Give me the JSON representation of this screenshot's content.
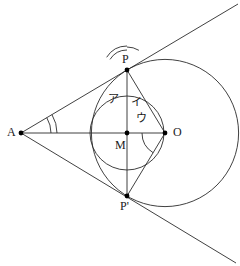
{
  "figure": {
    "width": 240,
    "height": 266,
    "background_color": "#ffffff",
    "stroke_color": "#2b2b2b",
    "point_color": "#000000"
  },
  "points": [
    {
      "id": "A",
      "label": "A",
      "x": 21,
      "y": 133,
      "label_x": 7,
      "label_y": 126,
      "dot": true
    },
    {
      "id": "P",
      "label": "P",
      "x": 127,
      "y": 70,
      "label_x": 122,
      "label_y": 53,
      "dot": true
    },
    {
      "id": "M",
      "label": "M",
      "x": 127,
      "y": 133,
      "label_x": 115,
      "label_y": 139,
      "dot": true
    },
    {
      "id": "O",
      "label": "O",
      "x": 165,
      "y": 133,
      "label_x": 173,
      "label_y": 126,
      "dot": true
    },
    {
      "id": "Pp",
      "label": "P'",
      "x": 127,
      "y": 196,
      "label_x": 120,
      "label_y": 200,
      "dot": true
    }
  ],
  "circles": [
    {
      "id": "big-circle",
      "center": "O",
      "cx": 165,
      "cy": 133,
      "r": 73.6
    },
    {
      "id": "small-circle",
      "center": "M",
      "cx": 127,
      "cy": 133,
      "r": 37.0
    }
  ],
  "segments": [
    {
      "id": "tangent-upper",
      "from_x": 21,
      "from_y": 133,
      "to_x": 238,
      "to_y": 4
    },
    {
      "id": "tangent-lower",
      "from_x": 21,
      "from_y": 133,
      "to_x": 236,
      "to_y": 263
    },
    {
      "id": "axis-AO",
      "from_x": 21,
      "from_y": 133,
      "to_x": 165,
      "to_y": 133
    },
    {
      "id": "chord-PPp",
      "from_x": 127,
      "from_y": 70,
      "to_x": 127,
      "to_y": 196
    },
    {
      "id": "radius-OP",
      "from_x": 165,
      "from_y": 133,
      "to_x": 127,
      "to_y": 70
    },
    {
      "id": "radius-OPp",
      "from_x": 165,
      "from_y": 133,
      "to_x": 127,
      "to_y": 196
    }
  ],
  "angles": [
    {
      "id": "angle-a",
      "label": "ア",
      "vertex": "P",
      "vertex_x": 127,
      "vertex_y": 70,
      "label_x": 108,
      "label_y": 94,
      "radii": [
        20,
        24
      ],
      "start_deg": 90,
      "end_deg": 148,
      "arc_count": 1
    },
    {
      "id": "angle-i",
      "label": "イ",
      "vertex": "P",
      "vertex_x": 127,
      "vertex_y": 70,
      "label_x": 131,
      "label_y": 97,
      "radii": [
        23
      ],
      "start_deg": 58.9,
      "end_deg": 90,
      "arc_count": 1
    },
    {
      "id": "angle-u",
      "label": "ウ",
      "vertex": "O",
      "vertex_x": 165,
      "vertex_y": 133,
      "label_x": 136,
      "label_y": 113,
      "radii": [
        23
      ],
      "start_deg": 180,
      "end_deg": 238.9,
      "arc_count": 1
    },
    {
      "id": "angle-A-double",
      "label": "",
      "vertex": "A",
      "vertex_x": 21,
      "vertex_y": 133,
      "label_x": 0,
      "label_y": 0,
      "radii": [
        30,
        36
      ],
      "start_deg": 0,
      "end_deg": 30.7,
      "arc_count": 2
    }
  ],
  "labels": {
    "A": "A",
    "P": "P",
    "M": "M",
    "O": "O",
    "P_prime": "P'",
    "angle_a": "ア",
    "angle_i": "イ",
    "angle_u": "ウ"
  }
}
